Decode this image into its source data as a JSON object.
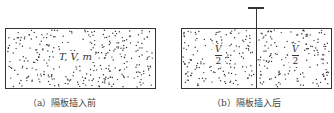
{
  "figure_a": {
    "label": "T, V, m",
    "caption": "（a）隔板插入前"
  },
  "figure_b": {
    "left_fraction": {
      "numerator": "V",
      "denominator": "2"
    },
    "right_fraction": {
      "numerator": "V",
      "denominator": "2"
    },
    "caption": "（b）隔板插入后"
  },
  "colors": {
    "line": "#333333",
    "dot": "#333333",
    "background": "#ffffff"
  }
}
